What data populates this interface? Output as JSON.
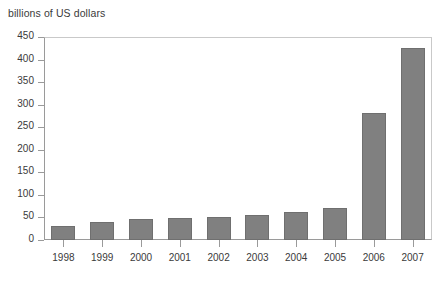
{
  "chart_data": {
    "type": "bar",
    "title": "billions of US dollars",
    "xlabel": "",
    "ylabel": "billions of US dollars",
    "categories": [
      "1998",
      "1999",
      "2000",
      "2001",
      "2002",
      "2003",
      "2004",
      "2005",
      "2006",
      "2007"
    ],
    "values": [
      32,
      40,
      47,
      48,
      52,
      55,
      63,
      70,
      281,
      425
    ],
    "ylim": [
      0,
      450
    ],
    "ytick_values": [
      0,
      50,
      100,
      150,
      200,
      250,
      300,
      350,
      400,
      450
    ],
    "ytick_labels": [
      "0",
      "50",
      "100",
      "150",
      "200",
      "250",
      "300",
      "350",
      "400",
      "450"
    ],
    "grid": false,
    "legend": null,
    "bar_color": "#808080",
    "bar_edge_color": "#6f6f6f",
    "axis_color": "#9a9a9a",
    "frame_color": "#c9c9c9",
    "text_color": "#3a3a3a"
  }
}
